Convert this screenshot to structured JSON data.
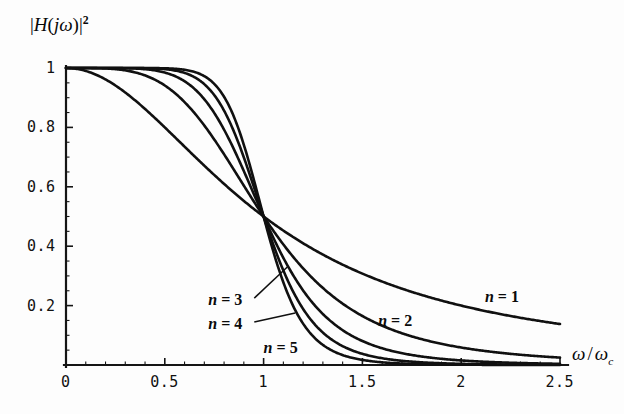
{
  "chart_data": {
    "type": "line",
    "title": "",
    "subtitle": "",
    "ylabel": "|H(jω)|²",
    "xlabel": "ω / ωc",
    "xlim": [
      0,
      2.5
    ],
    "ylim": [
      0,
      1.05
    ],
    "grid": false,
    "legend_position": "inline-annotations",
    "x_ticks": [
      "0",
      "0.5",
      "1",
      "1.5",
      "2",
      "2.5"
    ],
    "x_tick_values": [
      0,
      0.5,
      1,
      1.5,
      2,
      2.5
    ],
    "x_minor_step": 0.1,
    "y_ticks": [
      "0.2",
      "0.4",
      "0.6",
      "0.8",
      "1"
    ],
    "y_tick_values": [
      0.2,
      0.4,
      0.6,
      0.8,
      1
    ],
    "y_minor_step": 0.05,
    "formula": "1 / (1 + (w)^(2n))",
    "crossing_point": {
      "x": 1,
      "y": 0.5
    },
    "series": [
      {
        "name": "n = 1",
        "order": 1,
        "label_x": 2.12,
        "label_y": 0.225,
        "leader": false,
        "x": [
          0,
          0.1,
          0.2,
          0.3,
          0.4,
          0.5,
          0.6,
          0.7,
          0.8,
          0.9,
          1,
          1.1,
          1.2,
          1.3,
          1.4,
          1.5,
          1.6,
          1.7,
          1.8,
          1.9,
          2,
          2.1,
          2.2,
          2.3,
          2.4,
          2.5
        ],
        "y": [
          1,
          0.99,
          0.9615,
          0.9174,
          0.8621,
          0.8,
          0.7353,
          0.6711,
          0.6098,
          0.5525,
          0.5,
          0.4525,
          0.4098,
          0.3717,
          0.3378,
          0.3077,
          0.2809,
          0.2571,
          0.2358,
          0.2169,
          0.2,
          0.1848,
          0.1712,
          0.159,
          0.1479,
          0.1379
        ]
      },
      {
        "name": "n = 2",
        "order": 2,
        "label_x": 1.58,
        "label_y": 0.145,
        "leader": false,
        "x": [
          0,
          0.1,
          0.2,
          0.3,
          0.4,
          0.5,
          0.6,
          0.7,
          0.8,
          0.9,
          1,
          1.1,
          1.2,
          1.3,
          1.4,
          1.5,
          1.6,
          1.7,
          1.8,
          1.9,
          2,
          2.1,
          2.2,
          2.3,
          2.4,
          2.5
        ],
        "y": [
          1,
          0.9999,
          0.9984,
          0.9919,
          0.975,
          0.9412,
          0.8853,
          0.8063,
          0.7094,
          0.6045,
          0.5,
          0.4055,
          0.3254,
          0.259,
          0.2066,
          0.1649,
          0.1325,
          0.1071,
          0.0871,
          0.0714,
          0.0588,
          0.0488,
          0.0407,
          0.0342,
          0.0289,
          0.0246
        ]
      },
      {
        "name": "n = 3",
        "order": 3,
        "label_x": 0.72,
        "label_y": 0.215,
        "leader": true,
        "leader_to_x": 1.12,
        "leader_to_y": 0.33,
        "x": [
          0,
          0.1,
          0.2,
          0.3,
          0.4,
          0.5,
          0.6,
          0.7,
          0.8,
          0.9,
          1,
          1.1,
          1.2,
          1.3,
          1.4,
          1.5,
          1.6,
          1.7,
          1.8,
          1.9,
          2,
          2.1,
          2.2,
          2.3,
          2.4,
          2.5
        ],
        "y": [
          1,
          1,
          1,
          0.9993,
          0.9959,
          0.9846,
          0.9555,
          0.8953,
          0.7926,
          0.6529,
          0.5,
          0.3573,
          0.2439,
          0.1622,
          0.1069,
          0.0705,
          0.0468,
          0.0314,
          0.0213,
          0.0146,
          0.0102,
          0.0072,
          0.0051,
          0.0037,
          0.0027,
          0.002
        ]
      },
      {
        "name": "n = 4",
        "order": 4,
        "label_x": 0.72,
        "label_y": 0.135,
        "leader": true,
        "leader_to_x": 1.16,
        "leader_to_y": 0.175,
        "x": [
          0,
          0.1,
          0.2,
          0.3,
          0.4,
          0.5,
          0.6,
          0.7,
          0.8,
          0.9,
          1,
          1.1,
          1.2,
          1.3,
          1.4,
          1.5,
          1.6,
          1.7,
          1.8,
          1.9,
          2,
          2.1,
          2.2,
          2.3,
          2.4,
          2.5
        ],
        "y": [
          1,
          1,
          1,
          0.9999,
          0.9993,
          0.9961,
          0.9833,
          0.9466,
          0.8598,
          0.7014,
          0.5,
          0.3114,
          0.1727,
          0.0905,
          0.0465,
          0.0238,
          0.0124,
          0.0065,
          0.0035,
          0.0019,
          0.001,
          0.0006,
          0.0003,
          0.0002,
          0.0001,
          0.0001
        ]
      },
      {
        "name": "n = 5",
        "order": 5,
        "label_x": 1.0,
        "label_y": 0.055,
        "leader": false,
        "x": [
          0,
          0.1,
          0.2,
          0.3,
          0.4,
          0.5,
          0.6,
          0.7,
          0.8,
          0.9,
          1,
          1.1,
          1.2,
          1.3,
          1.4,
          1.5,
          1.6,
          1.7,
          1.8,
          1.9,
          2,
          2.1,
          2.2,
          2.3,
          2.4,
          2.5
        ],
        "y": [
          1,
          1,
          1,
          1,
          0.9999,
          0.999,
          0.9941,
          0.9723,
          0.9039,
          0.7418,
          0.5,
          0.2636,
          0.1148,
          0.0456,
          0.0174,
          0.0066,
          0.0025,
          0.001,
          0.0004,
          0.0002,
          0.0001,
          4e-05,
          2e-05,
          1e-05,
          4e-06,
          2e-06
        ]
      }
    ]
  },
  "axis": {
    "ylabel_parts": {
      "bar_left": "|",
      "h": "H",
      "paren_open": "(",
      "j": "j",
      "omega": "ω",
      "paren_close": ")",
      "bar_right": "|",
      "exponent": "2"
    },
    "xlabel_parts": {
      "omega": "ω",
      "slash": "/",
      "omega2": "ω",
      "subscript": "c"
    }
  },
  "style": {
    "curve_color": "#101010",
    "axis_color": "#151515",
    "background": "#fdfdfd",
    "curve_width": 2.6
  }
}
